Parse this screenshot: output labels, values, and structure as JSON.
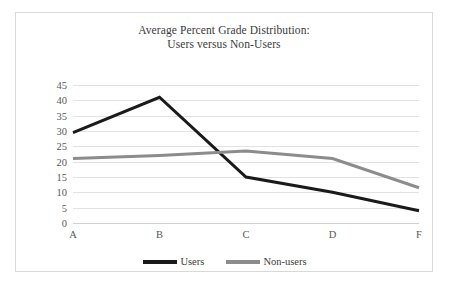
{
  "chart_data": {
    "type": "line",
    "title": "Average Percent Grade Distribution:\nUsers versus Non-Users",
    "title_line1": "Average Percent Grade Distribution:",
    "title_line2": "Users versus Non-Users",
    "xlabel": "",
    "ylabel": "",
    "categories": [
      "A",
      "B",
      "C",
      "D",
      "F"
    ],
    "yticks": [
      45,
      40,
      35,
      30,
      25,
      20,
      15,
      10,
      5,
      0
    ],
    "ylim": [
      0,
      45
    ],
    "grid": true,
    "legend_position": "bottom",
    "series": [
      {
        "name": "Users",
        "color": "#1a1a1a",
        "values": [
          29.5,
          41,
          15,
          10,
          4
        ]
      },
      {
        "name": "Non-users",
        "color": "#8c8c8c",
        "values": [
          21,
          22,
          23.5,
          21,
          11.5
        ]
      }
    ]
  },
  "legend": {
    "items": [
      {
        "label": "Users",
        "color": "#1a1a1a"
      },
      {
        "label": "Non-users",
        "color": "#8c8c8c"
      }
    ]
  },
  "colors": {
    "users": "#1a1a1a",
    "non_users": "#8c8c8c",
    "gridline": "#e2e2e2",
    "border": "#d9d9d9",
    "text": "#3a3a3a",
    "tick_text": "#595959"
  }
}
